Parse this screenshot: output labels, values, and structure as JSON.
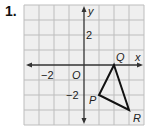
{
  "problem_number": "1.",
  "axes": {
    "x_label": "x",
    "y_label": "y",
    "origin_label": "O",
    "ticks": [
      {
        "axis": "y",
        "value": 2,
        "label": "2"
      },
      {
        "axis": "x",
        "value": -2,
        "label": "−2"
      },
      {
        "axis": "y",
        "value": -2,
        "label": "−2"
      }
    ]
  },
  "grid": {
    "x_min": -4,
    "x_max": 4,
    "y_min": -4,
    "y_max": 4
  },
  "triangle": {
    "vertices": [
      {
        "label": "Q",
        "x": 2,
        "y": 0
      },
      {
        "label": "P",
        "x": 1,
        "y": -2
      },
      {
        "label": "R",
        "x": 3,
        "y": -3
      }
    ]
  }
}
